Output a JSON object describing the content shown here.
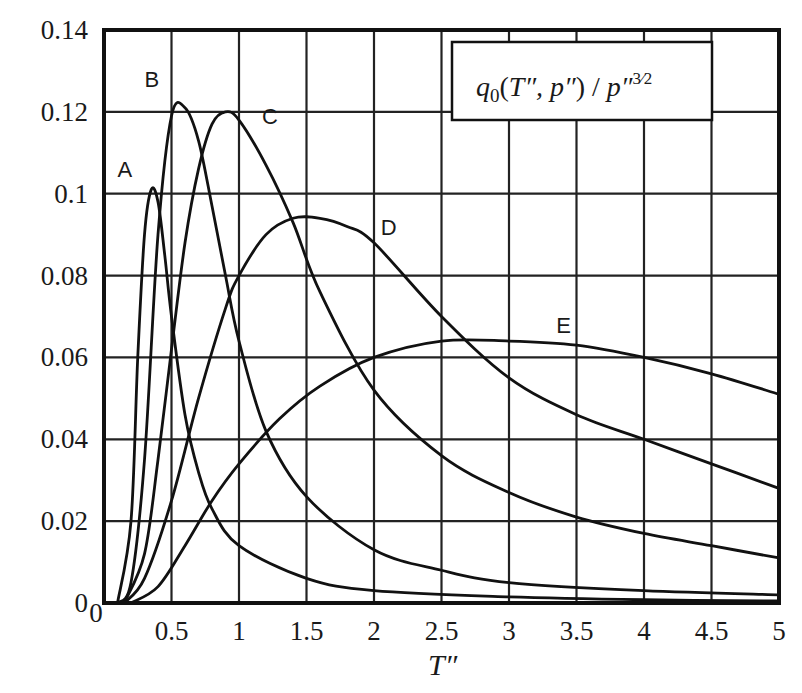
{
  "chart_data": {
    "type": "line",
    "xlabel": "T″",
    "ylabel": "",
    "xlim": [
      0,
      5
    ],
    "ylim": [
      0,
      0.14
    ],
    "grid": true,
    "x_ticks": [
      "0",
      "0.5",
      "1",
      "1.5",
      "2",
      "2.5",
      "3",
      "3.5",
      "4",
      "4.5",
      "5"
    ],
    "y_ticks": [
      "0",
      "0.02",
      "0.04",
      "0.06",
      "0.08",
      "0.1",
      "0.12",
      "0.14"
    ],
    "legend": {
      "text": "q0(T″, p″) / p″3/2",
      "position": "top-right"
    },
    "series": [
      {
        "name": "A",
        "x": [
          0.1,
          0.2,
          0.25,
          0.3,
          0.35,
          0.4,
          0.45,
          0.5,
          0.6,
          0.7,
          0.8,
          1.0,
          1.5,
          2.0,
          3.0,
          4.0,
          5.0
        ],
        "y": [
          0,
          0.02,
          0.06,
          0.09,
          0.101,
          0.098,
          0.085,
          0.07,
          0.046,
          0.032,
          0.023,
          0.014,
          0.006,
          0.003,
          0.0015,
          0.0008,
          0.0005
        ]
      },
      {
        "name": "B",
        "x": [
          0.1,
          0.2,
          0.3,
          0.4,
          0.5,
          0.6,
          0.7,
          0.8,
          0.9,
          1.0,
          1.2,
          1.5,
          2.0,
          2.5,
          3.0,
          4.0,
          5.0
        ],
        "y": [
          0,
          0.005,
          0.035,
          0.09,
          0.119,
          0.121,
          0.113,
          0.097,
          0.08,
          0.064,
          0.042,
          0.026,
          0.013,
          0.008,
          0.005,
          0.003,
          0.002
        ]
      },
      {
        "name": "C",
        "x": [
          0.15,
          0.3,
          0.4,
          0.5,
          0.6,
          0.7,
          0.8,
          0.9,
          1.0,
          1.2,
          1.4,
          1.6,
          2.0,
          2.5,
          3.0,
          3.5,
          4.0,
          4.5,
          5.0
        ],
        "y": [
          0,
          0.012,
          0.035,
          0.062,
          0.088,
          0.106,
          0.117,
          0.12,
          0.118,
          0.107,
          0.093,
          0.076,
          0.052,
          0.036,
          0.027,
          0.021,
          0.017,
          0.014,
          0.011
        ]
      },
      {
        "name": "D",
        "x": [
          0.15,
          0.3,
          0.5,
          0.7,
          0.9,
          1.0,
          1.2,
          1.4,
          1.6,
          1.8,
          2.0,
          2.5,
          3.0,
          3.5,
          4.0,
          4.5,
          5.0
        ],
        "y": [
          0,
          0.006,
          0.025,
          0.05,
          0.072,
          0.08,
          0.09,
          0.094,
          0.094,
          0.092,
          0.088,
          0.07,
          0.055,
          0.046,
          0.04,
          0.034,
          0.028
        ]
      },
      {
        "name": "E",
        "x": [
          0.2,
          0.4,
          0.6,
          0.8,
          1.0,
          1.3,
          1.6,
          2.0,
          2.5,
          3.0,
          3.5,
          4.0,
          4.5,
          5.0
        ],
        "y": [
          0,
          0.004,
          0.014,
          0.025,
          0.034,
          0.045,
          0.053,
          0.06,
          0.064,
          0.064,
          0.063,
          0.06,
          0.056,
          0.051
        ]
      }
    ],
    "curve_labels": [
      {
        "text": "A",
        "x": 0.1,
        "y": 0.104
      },
      {
        "text": "B",
        "x": 0.3,
        "y": 0.126
      },
      {
        "text": "C",
        "x": 1.17,
        "y": 0.117
      },
      {
        "text": "D",
        "x": 2.05,
        "y": 0.09
      },
      {
        "text": "E",
        "x": 3.35,
        "y": 0.066
      }
    ]
  }
}
